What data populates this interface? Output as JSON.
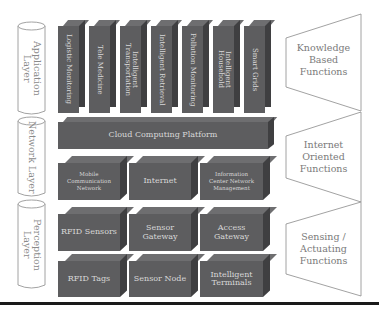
{
  "layers": [
    {
      "id": "application",
      "label": "Application\nLayer"
    },
    {
      "id": "network",
      "label": "Network Layer"
    },
    {
      "id": "perception",
      "label": "Perception\nLayer"
    }
  ],
  "application_layer": {
    "pillars": [
      {
        "label": "Logistic Monitoring"
      },
      {
        "label": "Tele Medicine"
      },
      {
        "label": "Intelligent\nTransportation"
      },
      {
        "label": "Intelligent Retrieval"
      },
      {
        "label": "Pollution Monitoring"
      },
      {
        "label": "Intelligent\nHousehold"
      },
      {
        "label": "Smart Grids"
      }
    ]
  },
  "network_layer": {
    "platform": {
      "label": "Cloud Computing Platform"
    },
    "boxes": [
      {
        "label": "Mobile\nCommunication\nNetwork",
        "size": "small"
      },
      {
        "label": "Internet",
        "size": "wide"
      },
      {
        "label": "Information\nCenter Network\nManagement",
        "size": "small"
      }
    ]
  },
  "perception_layer": {
    "row1": [
      {
        "label": "RFID Sensors"
      },
      {
        "label": "Sensor\nGateway"
      },
      {
        "label": "Access\nGateway"
      }
    ],
    "row2": [
      {
        "label": "RFID Tags"
      },
      {
        "label": "Sensor Node"
      },
      {
        "label": "Intelligent\nTerminals"
      }
    ]
  },
  "functions": [
    {
      "label": "Knowledge\nBased\nFunctions"
    },
    {
      "label": "Internet\nOriented\nFunctions"
    },
    {
      "label": "Sensing /\nActuating\nFunctions"
    }
  ],
  "colors": {
    "box_front": "#5d5d5f",
    "box_top": "#6e6e70",
    "box_side": "#3f3f41",
    "box_text": "#d8d8d8",
    "outline": "#8a8a8a"
  }
}
